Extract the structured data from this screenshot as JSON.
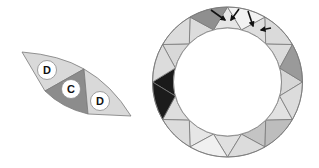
{
  "figure": {
    "width": 319,
    "height": 168,
    "background": "#ffffff",
    "stroke_color": "#7a7a7a",
    "stroke_width": 0.8
  },
  "fragment": {
    "outline": {
      "top_left_tip": [
        22,
        52
      ],
      "arc_control": [
        60,
        55
      ],
      "top_mid": [
        84,
        69
      ],
      "arc_control_2": [
        112,
        85
      ],
      "bottom_right_tip": [
        131,
        116
      ],
      "bottom_mid": [
        88,
        114
      ],
      "inner_arc_control": [
        62,
        108
      ],
      "bottom_left": [
        45,
        91
      ]
    },
    "regions": [
      {
        "name": "fragment-left-segment",
        "fill": "#d9d9d9",
        "points": "22,52 Q60,55 84,69 L45,91 Z"
      },
      {
        "name": "fragment-center-segment",
        "fill": "#8c8c8c",
        "points": "45,91 L84,69 L88,114 Q62,108 45,91 Z"
      },
      {
        "name": "fragment-right-segment",
        "fill": "#d9d9d9",
        "points": "84,69 Q112,85 131,116 L88,114 Z"
      }
    ],
    "markers": [
      {
        "label": "D",
        "cx": 47,
        "cy": 70,
        "r": 9.5
      },
      {
        "label": "C",
        "cx": 71,
        "cy": 89,
        "r": 9.5
      },
      {
        "label": "D",
        "cx": 100,
        "cy": 101,
        "r": 9.5
      }
    ],
    "marker_fill": "#ffffff",
    "marker_stroke": "#8a8a8a"
  },
  "ring": {
    "cx": 227.5,
    "cy": 82,
    "outer_r": 75,
    "inner_r": 54,
    "segments": 12,
    "outer_band_fill": "#dcdcdc",
    "inward_triangle_fills": [
      "#f2f2f2",
      "#dadada",
      "#9a9a9a",
      "#dcdcdc",
      "#bdbdbd",
      "#dcdcdc",
      "#f0f0f0",
      "#dcdcdc",
      "#1c1c1c",
      "#dcdcdc",
      "#dcdcdc",
      "#8f8f8f"
    ],
    "outward_triangle_fills": [
      "#e6e6e6",
      "#dedede",
      "#dcdcdc",
      "#d6d6d6",
      "#e2e2e2",
      "#c4c4c4",
      "#e0e0e0",
      "#e6e6e6",
      "#dedede",
      "#1a1a1a",
      "#d8d8d8",
      "#dcdcdc"
    ]
  },
  "arrows": [
    {
      "from": [
        211,
        10
      ],
      "to": [
        225,
        20
      ]
    },
    {
      "from": [
        239,
        9
      ],
      "to": [
        231,
        20
      ]
    },
    {
      "from": [
        248,
        11
      ],
      "to": [
        253,
        26
      ]
    },
    {
      "from": [
        271,
        28
      ],
      "to": [
        261,
        30
      ]
    }
  ],
  "arrow_color": "#111111"
}
